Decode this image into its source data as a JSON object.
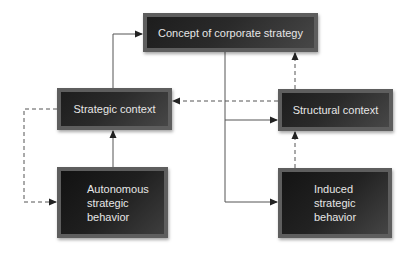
{
  "diagram": {
    "nodes": {
      "corporate": {
        "label": "Concept of corporate strategy"
      },
      "strategic": {
        "label": "Strategic context"
      },
      "structural": {
        "label": "Structural context"
      },
      "autonomous": {
        "label": "Autonomous\nstrategic\nbehavior"
      },
      "induced": {
        "label": "Induced\nstrategic\nbehavior"
      }
    },
    "edges": [
      {
        "from": "Strategic context",
        "to": "Concept of corporate strategy",
        "style": "solid"
      },
      {
        "from": "Concept of corporate strategy",
        "to": "Structural context",
        "style": "solid"
      },
      {
        "from": "Concept of corporate strategy",
        "to": "Induced strategic behavior",
        "style": "solid"
      },
      {
        "from": "Structural context",
        "to": "Concept of corporate strategy",
        "style": "dashed"
      },
      {
        "from": "Structural context",
        "to": "Strategic context",
        "style": "dashed"
      },
      {
        "from": "Strategic context",
        "to": "Autonomous strategic behavior",
        "style": "dashed"
      },
      {
        "from": "Autonomous strategic behavior",
        "to": "Strategic context",
        "style": "solid"
      },
      {
        "from": "Induced strategic behavior",
        "to": "Structural context",
        "style": "dashed"
      }
    ],
    "colors": {
      "box_border": "#5e5e5e",
      "box_fill_dark": "#1d1d1d",
      "box_fill_light": "#474747",
      "box_text": "#e6e6e6",
      "line": "#555555",
      "arrowhead": "#222222"
    }
  }
}
